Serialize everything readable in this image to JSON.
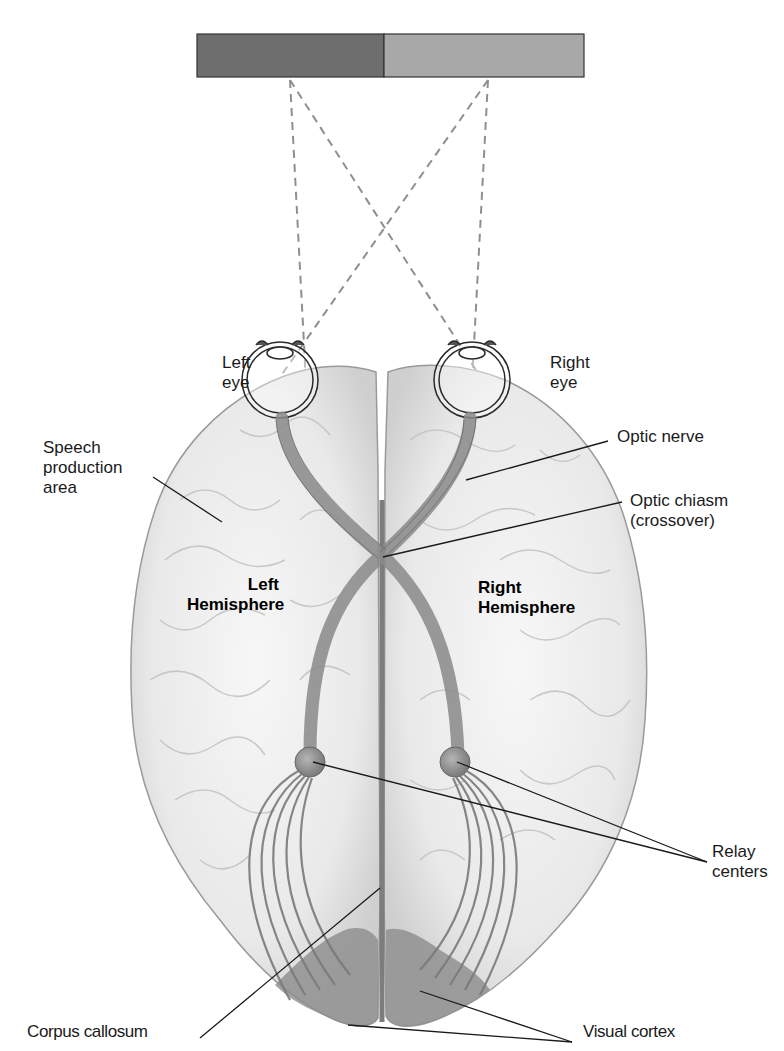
{
  "diagram": {
    "type": "anatomical",
    "visual_field": {
      "left_half_color": "#6e6e6e",
      "right_half_color": "#a8a8a8"
    },
    "labels": {
      "left_eye": "Left\neye",
      "right_eye": "Right\neye",
      "speech_area": "Speech\nproduction\narea",
      "optic_nerve": "Optic nerve",
      "optic_chiasm": "Optic chiasm\n(crossover)",
      "left_hemisphere": "Left\nHemisphere",
      "right_hemisphere": "Right\nHemisphere",
      "relay_centers": "Relay\ncenters",
      "corpus_callosum": "Corpus callosum",
      "visual_cortex": "Visual cortex"
    },
    "colors": {
      "brain_fill": "#ececec",
      "brain_outline": "#9a9a9a",
      "pathway": "#8a8a8a",
      "visual_cortex": "#8c8c8c",
      "dashed_rays": "#8f8f8f",
      "leader_lines": "#1a1a1a"
    }
  }
}
